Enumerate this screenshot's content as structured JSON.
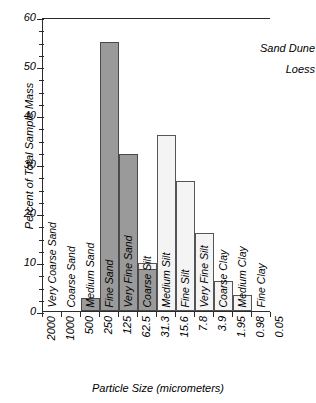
{
  "chart_data": {
    "type": "bar",
    "title": "",
    "xlabel": "Particle Size (micrometers)",
    "ylabel": "Percent of Total Sample Mass",
    "ylim": [
      0,
      60
    ],
    "ytick_labels": [
      "0",
      "10",
      "20",
      "30",
      "40",
      "50",
      "60"
    ],
    "ytick_values": [
      0,
      10,
      20,
      30,
      40,
      50,
      60
    ],
    "yminor_step": 2.5,
    "grid": false,
    "legend_position": "top-right",
    "xtick_labels": [
      "2000",
      "1000",
      "500",
      "250",
      "125",
      "62.5",
      "31.3",
      "15.6",
      "7.8",
      "3.9",
      "1.95",
      "0.98",
      "0.05"
    ],
    "categories": [
      "Very Coarse Sand",
      "Coarse Sand",
      "Medium Sand",
      "Fine Sand",
      "Very Fine Sand",
      "Coarse Silt",
      "Medium Silt",
      "Fine Silt",
      "Very Fine Silt",
      "Coarse Clay",
      "Medium Clay",
      "Fine Clay"
    ],
    "series": [
      {
        "name": "Sand Dune",
        "color": "#9a9a9a",
        "values": [
          0,
          0,
          2.6,
          55,
          32,
          8.6,
          0,
          0,
          0,
          0,
          0,
          0
        ]
      },
      {
        "name": "Loess",
        "color": "#f4f4f4",
        "values": [
          0,
          0,
          0,
          0,
          1.6,
          9.8,
          36,
          26.5,
          16,
          6.2,
          3.2,
          0
        ]
      }
    ]
  },
  "legend": {
    "items": [
      {
        "label": "Sand Dune",
        "swatch": "dune"
      },
      {
        "label": "Loess",
        "swatch": "loess"
      }
    ]
  },
  "axes": {
    "y_title": "Percent of Total Sample Mass",
    "x_title": "Particle Size (micrometers)"
  }
}
